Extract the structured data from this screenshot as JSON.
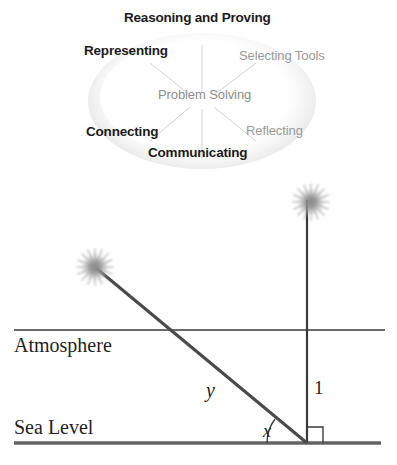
{
  "page": {
    "width": 397,
    "height": 465,
    "background": "#ffffff"
  },
  "process_diagram": {
    "shape": "ellipse",
    "center_label": "Problem Solving",
    "spoke_count": 6,
    "colors": {
      "bold_text": "#1b1b1b",
      "light_text": "#9a9a9a",
      "ellipse_edge": "#c6c6c6",
      "spoke_line": "#cfcfcf"
    },
    "labels": [
      {
        "id": "reasoning",
        "text": "Reasoning and Proving",
        "style": "bold",
        "position": "top"
      },
      {
        "id": "representing",
        "text": "Representing",
        "style": "bold",
        "position": "upper-left"
      },
      {
        "id": "selecting",
        "text": "Selecting Tools",
        "style": "light",
        "position": "upper-right"
      },
      {
        "id": "problem",
        "text": "Problem Solving",
        "style": "light",
        "position": "center"
      },
      {
        "id": "connecting",
        "text": "Connecting",
        "style": "bold",
        "position": "lower-left"
      },
      {
        "id": "reflecting",
        "text": "Reflecting",
        "style": "light",
        "position": "lower-right"
      },
      {
        "id": "communicating",
        "text": "Communicating",
        "style": "bold",
        "position": "bottom"
      }
    ]
  },
  "trig_figure": {
    "title_labels": {
      "atmosphere": "Atmosphere",
      "sea_level": "Sea Level"
    },
    "math_labels": {
      "hypotenuse": "y",
      "vertical_side": "1",
      "angle": "x"
    },
    "markers": {
      "right_angle": "right-angle-square",
      "angle_arc": "angle-arc"
    },
    "objects": [
      {
        "id": "star-left",
        "kind": "starburst",
        "cx": 95,
        "cy": 267
      },
      {
        "id": "star-right",
        "kind": "starburst",
        "cx": 311,
        "cy": 202
      }
    ],
    "geometry": {
      "vertex": {
        "x": 307,
        "y": 443
      },
      "atmosphere_line_y": 330,
      "sea_level_line_y": 443,
      "vertical_top_y": 200,
      "hypotenuse_far_end": {
        "x": 96,
        "y": 268
      }
    },
    "colors": {
      "line": "#3a3a3a",
      "sea_level_line": "#636363",
      "star": "#9b9b9b",
      "text": "#1f1f1f"
    }
  }
}
